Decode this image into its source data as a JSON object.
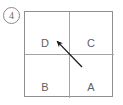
{
  "figure": {
    "item_number": "4",
    "item_number_style": "circled",
    "background_color": "#ffffff",
    "box": {
      "border_color": "#8f8f8f",
      "divider_color": "#a5a5a5",
      "fill_color": "#ffffff"
    },
    "quadrants": [
      {
        "id": "top-left",
        "label": "D"
      },
      {
        "id": "top-right",
        "label": "C"
      },
      {
        "id": "bottom-left",
        "label": "B"
      },
      {
        "id": "bottom-right",
        "label": "A"
      }
    ],
    "arrow": {
      "color": "#1a1a1a",
      "from_quadrant": "A",
      "to_quadrant": "D",
      "direction": "up-left",
      "tail_x": 82,
      "tail_y": 67,
      "tip_x": 54,
      "tip_y": 38
    }
  }
}
